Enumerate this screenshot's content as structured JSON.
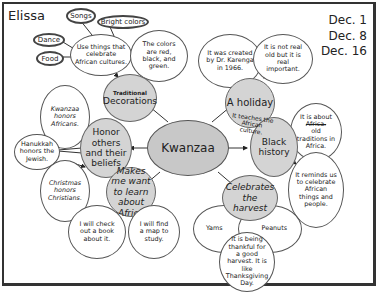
{
  "header": {
    "name": "Elissa",
    "dates": [
      "Dec. 1",
      "Dec. 8",
      "Dec. 16"
    ]
  },
  "center": {
    "label": "Kwanzaa"
  },
  "branches": {
    "decorations": {
      "label_line1": "Traditional",
      "label_line2": "Decorations",
      "children": {
        "celebrate": "Use things that celebrate African cultures.",
        "colors": "The colors are red, black, and green."
      },
      "sub_items": [
        "Songs",
        "Bright colors",
        "Dance",
        "Food"
      ]
    },
    "holiday": {
      "label": "A holiday",
      "children": {
        "created": "It was created by Dr. Karenga in 1966.",
        "important": "It is not real old but it is real important."
      }
    },
    "honor": {
      "label": "Honor others and their beliefs",
      "children": {
        "kwanzaa": "Kwanzaa honors Africans.",
        "hanukkah": "Hanukkah honors the Jewish.",
        "christmas": "Christmas honors Christians."
      }
    },
    "black_history": {
      "label": "Black history",
      "overlay_note": "It teaches the African culture.",
      "children": {
        "about_struck": "Africa.",
        "about_prefix": "It is about",
        "about_suffix": "old traditions in Africa.",
        "reminds": "It reminds us to celebrate African things and people."
      }
    },
    "learn": {
      "label": "Makes me want to learn about Africa",
      "children": {
        "book": "I will check out a book about it.",
        "map": "I will find a map to study."
      }
    },
    "harvest": {
      "label": "Celebrates the harvest",
      "children": {
        "yams": "Yams",
        "peanuts": "Peanuts",
        "thankful": "It is being thankful for a good harvest. It is like Thanksgiving Day."
      }
    }
  },
  "colors": {
    "node_fill": "#d4d4d4",
    "center_fill": "#c8c8c8",
    "line": "#333333"
  }
}
